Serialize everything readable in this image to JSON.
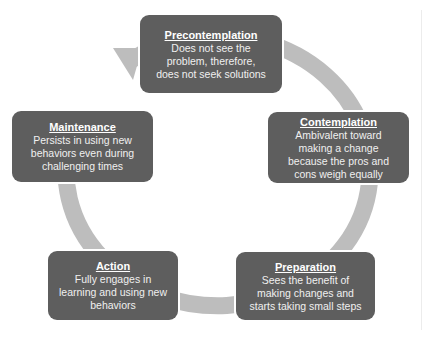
{
  "diagram": {
    "type": "cycle",
    "colors": {
      "box_fill": "#5e5e5e",
      "box_text": "#ffffff",
      "ring": "#bdbdbd",
      "background": "#ffffff"
    },
    "stages": [
      {
        "id": "precontemplation",
        "title": "Precontemplation",
        "description": "Does not see the\nproblem, therefore,\ndoes not seek solutions"
      },
      {
        "id": "contemplation",
        "title": "Contemplation",
        "description": "Ambivalent toward\nmaking a change\nbecause the pros and\ncons weigh equally"
      },
      {
        "id": "preparation",
        "title": "Preparation",
        "description": "Sees the benefit of\nmaking changes and\nstarts taking small steps"
      },
      {
        "id": "action",
        "title": "Action",
        "description": "Fully engages in\nlearning and using new\nbehaviors"
      },
      {
        "id": "maintenance",
        "title": "Maintenance",
        "description": "Persists in using new\nbehaviors even during\nchallenging times"
      }
    ],
    "cycle_direction": "clockwise",
    "arrow": "arrowhead pointing from Maintenance into Precontemplation"
  }
}
